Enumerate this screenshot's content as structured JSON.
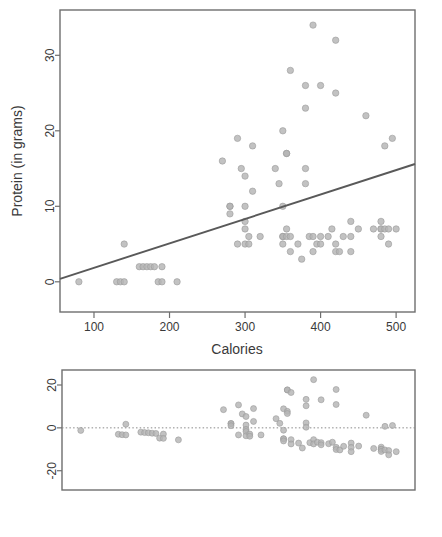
{
  "figure": {
    "title": "",
    "background": "#ffffff",
    "point_color": "#b4b4b4",
    "line_color": "#595959",
    "axis_color": "#6e6e6e"
  },
  "chart_data": [
    {
      "type": "scatter",
      "name": "protein-vs-calories",
      "title": "",
      "xlabel": "Calories",
      "ylabel": "Protein (in grams)",
      "xlim": [
        55,
        525
      ],
      "ylim": [
        -4,
        36
      ],
      "xticks": [
        100,
        200,
        300,
        400,
        500
      ],
      "yticks": [
        0,
        10,
        20,
        30
      ],
      "xtick_labels": [
        "100",
        "200",
        "300",
        "400",
        "500"
      ],
      "ytick_labels": [
        "0",
        "10",
        "20",
        "30"
      ],
      "grid": false,
      "legend": "none",
      "x": [
        80,
        130,
        135,
        140,
        140,
        160,
        165,
        170,
        175,
        180,
        185,
        190,
        190,
        210,
        270,
        280,
        280,
        280,
        290,
        290,
        295,
        300,
        300,
        300,
        300,
        300,
        305,
        305,
        310,
        310,
        320,
        340,
        345,
        350,
        350,
        350,
        350,
        350,
        355,
        355,
        355,
        355,
        360,
        360,
        360,
        370,
        375,
        380,
        380,
        380,
        380,
        385,
        390,
        390,
        390,
        395,
        400,
        400,
        400,
        410,
        415,
        420,
        420,
        420,
        420,
        425,
        430,
        440,
        440,
        440,
        450,
        460,
        470,
        480,
        480,
        480,
        480,
        485,
        485,
        490,
        490,
        495,
        500
      ],
      "y": [
        0,
        0,
        0,
        0,
        5,
        2,
        2,
        2,
        2,
        2,
        0,
        2,
        0,
        0,
        16,
        10,
        10,
        9,
        19,
        5,
        15,
        14,
        10,
        8,
        7,
        5,
        6,
        5,
        18,
        12,
        6,
        15,
        13,
        20,
        10,
        6,
        6,
        5,
        17,
        17,
        7,
        6,
        28,
        6,
        4,
        5,
        3,
        26,
        23,
        15,
        13,
        6,
        34,
        6,
        4,
        5,
        26,
        6,
        5,
        6,
        7,
        32,
        25,
        5,
        4,
        4,
        6,
        8,
        6,
        4,
        7,
        22,
        7,
        8,
        7,
        7,
        6,
        18,
        7,
        7,
        5,
        19,
        7
      ],
      "regression_line": {
        "label": "least-squares fit",
        "x_start": 55,
        "y_start": 0.4,
        "x_end": 525,
        "y_end": 15.6
      }
    },
    {
      "type": "scatter",
      "name": "residuals-vs-calories",
      "title": "",
      "xlabel": "",
      "ylabel": "",
      "xlim": [
        55,
        525
      ],
      "ylim": [
        -29,
        27
      ],
      "xticks": [],
      "yticks": [
        -20,
        0,
        20
      ],
      "xtick_labels": [],
      "ytick_labels": [
        "-20",
        "0",
        "20"
      ],
      "grid": false,
      "legend": "none",
      "zero_reference_line": 0,
      "x": [
        80,
        130,
        135,
        140,
        140,
        160,
        165,
        170,
        175,
        180,
        185,
        190,
        190,
        210,
        270,
        280,
        280,
        280,
        290,
        290,
        295,
        300,
        300,
        300,
        300,
        300,
        305,
        305,
        310,
        310,
        320,
        340,
        345,
        350,
        350,
        350,
        350,
        350,
        355,
        355,
        355,
        355,
        360,
        360,
        360,
        370,
        375,
        380,
        380,
        380,
        380,
        385,
        390,
        390,
        390,
        395,
        400,
        400,
        400,
        410,
        415,
        420,
        420,
        420,
        420,
        425,
        430,
        440,
        440,
        440,
        450,
        460,
        470,
        480,
        480,
        480,
        480,
        485,
        485,
        490,
        490,
        495,
        500
      ],
      "y": [
        -1.2,
        -3.0,
        -3.2,
        -3.3,
        1.7,
        -2.0,
        -2.2,
        -2.3,
        -2.5,
        -2.6,
        -4.8,
        -2.9,
        -4.9,
        -5.6,
        8.5,
        2.0,
        2.0,
        1.0,
        10.7,
        -3.3,
        6.5,
        5.3,
        1.3,
        -0.7,
        -1.7,
        -3.7,
        -2.9,
        -3.9,
        9.0,
        3.0,
        -3.3,
        4.3,
        2.1,
        8.9,
        -1.1,
        -5.1,
        -5.1,
        -6.1,
        17.7,
        17.7,
        7.7,
        6.7,
        16.5,
        -5.5,
        -7.5,
        -7.1,
        -9.4,
        13.3,
        10.3,
        2.3,
        0.3,
        -6.9,
        22.5,
        -5.5,
        -7.5,
        -6.7,
        13.1,
        -6.9,
        -7.9,
        -7.4,
        -6.7,
        17.9,
        10.9,
        -9.1,
        -10.1,
        -10.3,
        -8.6,
        -7.1,
        -9.1,
        -11.1,
        -8.5,
        5.9,
        -9.6,
        -9.0,
        -10.0,
        -10.0,
        -11.0,
        0.7,
        -10.3,
        -10.6,
        -12.6,
        1.1,
        -11.1
      ]
    }
  ]
}
